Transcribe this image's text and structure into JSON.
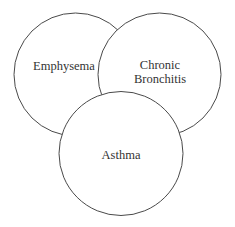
{
  "diagram": {
    "type": "venn",
    "sets": [
      {
        "id": "emphysema",
        "label_lines": [
          "Emphysema"
        ],
        "cx": 75.5,
        "cy": 74.5,
        "r": 61.5
      },
      {
        "id": "chronic-bronchitis",
        "label_lines": [
          "Chronic",
          "Bronchitis"
        ],
        "cx": 159.5,
        "cy": 74.5,
        "r": 61.5
      },
      {
        "id": "asthma",
        "label_lines": [
          "Asthma"
        ],
        "cx": 121,
        "cy": 153.5,
        "r": 62
      }
    ],
    "colors": {
      "stroke": "#4a4a4a",
      "fill": "#ffffff",
      "text": "#333333",
      "background": "#ffffff"
    }
  }
}
